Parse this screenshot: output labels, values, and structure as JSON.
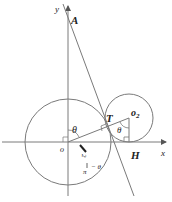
{
  "diagram": {
    "axes": {
      "x_label": "x",
      "y_label": "y",
      "origin_label": "o"
    },
    "points": {
      "A": "A",
      "T": "T",
      "O2": "o",
      "O2_sub": "2",
      "H": "H"
    },
    "angles": {
      "theta_at_origin": "θ",
      "theta_at_o2": "θ",
      "complement_num": "π",
      "complement_den": "2",
      "complement_rest": "− θ"
    },
    "colors": {
      "stroke": "#7a7a7a",
      "text": "#222222",
      "background": "#ffffff"
    }
  }
}
